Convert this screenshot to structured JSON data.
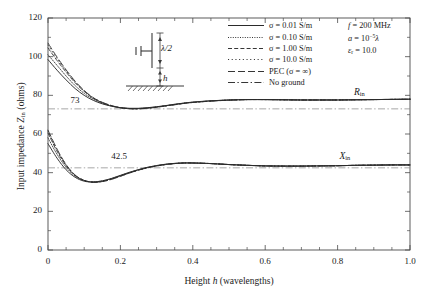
{
  "chart_data": {
    "type": "line",
    "title": "",
    "xlabel": "Height h (wavelengths)",
    "ylabel": "Input impedance Zin (ohms)",
    "xlim": [
      0,
      1.0
    ],
    "ylim": [
      0,
      120
    ],
    "xticks": [
      "0",
      "0.2",
      "0.4",
      "0.6",
      "0.8",
      "1.0"
    ],
    "xtick_values": [
      0,
      0.2,
      0.4,
      0.6,
      0.8,
      1.0
    ],
    "yticks": [
      "0",
      "20",
      "40",
      "60",
      "80",
      "100",
      "120"
    ],
    "ytick_values": [
      0,
      20,
      40,
      60,
      80,
      100,
      120
    ],
    "xminor_step": 0.05,
    "yminor_step": 10,
    "grid": false,
    "legend_position": "top-center",
    "annotations": [
      {
        "name": "Rin",
        "text": "Rin",
        "x": 0.845,
        "y": 80.5
      },
      {
        "name": "Xin",
        "text": "Xin",
        "x": 0.805,
        "y": 47.5
      },
      {
        "name": "asymptote-73",
        "text": "73",
        "x": 0.062,
        "y": 76.5
      },
      {
        "name": "asymptote-42.5",
        "text": "42.5",
        "x": 0.175,
        "y": 47.5
      }
    ],
    "reference_lines": [
      {
        "name": "free-space-resistance",
        "value": 73,
        "style": "dashdot"
      },
      {
        "name": "free-space-reactance",
        "value": 42.5,
        "style": "dashdot"
      }
    ],
    "parameters": [
      "f = 200 MHz",
      "a = 10−5λ",
      "εr = 10.0"
    ],
    "inset": {
      "dipole_length": "λ/2",
      "height_symbol": "h"
    },
    "x": [
      0,
      0.025,
      0.05,
      0.075,
      0.1,
      0.125,
      0.15,
      0.175,
      0.2,
      0.225,
      0.25,
      0.275,
      0.3,
      0.325,
      0.35,
      0.375,
      0.4,
      0.45,
      0.5,
      0.55,
      0.6,
      0.65,
      0.7,
      0.75,
      0.8,
      0.85,
      0.9,
      0.95,
      1.0
    ],
    "series": [
      {
        "name": "σ = 0.01 S/m",
        "style": "solid",
        "Rin": [
          98.5,
          93.0,
          88.0,
          83.5,
          80.0,
          77.4,
          75.6,
          74.4,
          73.6,
          73.3,
          73.3,
          73.6,
          74.1,
          74.7,
          75.4,
          76.0,
          76.5,
          77.2,
          77.6,
          77.8,
          77.8,
          77.7,
          77.6,
          77.6,
          77.6,
          77.7,
          77.8,
          77.9,
          78.0
        ],
        "Xin": [
          55.0,
          47.5,
          41.5,
          37.6,
          35.6,
          35.2,
          35.8,
          37.0,
          38.6,
          40.2,
          41.6,
          42.8,
          43.7,
          44.4,
          44.8,
          45.0,
          45.0,
          44.7,
          44.2,
          43.8,
          43.5,
          43.4,
          43.4,
          43.5,
          43.6,
          43.8,
          43.9,
          44.0,
          44.0
        ]
      },
      {
        "name": "σ = 0.10 S/m",
        "style": "dotted-fine",
        "Rin": [
          101.0,
          95.5,
          90.0,
          85.0,
          81.0,
          78.0,
          75.9,
          74.5,
          73.6,
          73.2,
          73.2,
          73.5,
          74.0,
          74.6,
          75.3,
          75.9,
          76.4,
          77.1,
          77.6,
          77.8,
          77.8,
          77.7,
          77.6,
          77.6,
          77.6,
          77.7,
          77.8,
          77.9,
          78.0
        ],
        "Xin": [
          58.0,
          49.5,
          42.8,
          38.2,
          35.9,
          35.2,
          35.7,
          36.9,
          38.5,
          40.1,
          41.5,
          42.7,
          43.6,
          44.3,
          44.8,
          45.0,
          45.0,
          44.7,
          44.2,
          43.8,
          43.5,
          43.4,
          43.4,
          43.5,
          43.6,
          43.8,
          43.9,
          44.0,
          44.0
        ]
      },
      {
        "name": "σ = 1.00 S/m",
        "style": "dashed",
        "Rin": [
          104.5,
          98.0,
          92.0,
          86.5,
          82.0,
          78.5,
          76.2,
          74.6,
          73.6,
          73.1,
          73.1,
          73.4,
          73.9,
          74.6,
          75.2,
          75.9,
          76.4,
          77.1,
          77.5,
          77.8,
          77.8,
          77.7,
          77.6,
          77.6,
          77.6,
          77.7,
          77.8,
          77.9,
          78.0
        ],
        "Xin": [
          60.5,
          51.0,
          43.6,
          38.5,
          36.0,
          35.1,
          35.5,
          36.7,
          38.3,
          39.9,
          41.4,
          42.6,
          43.5,
          44.2,
          44.7,
          45.0,
          45.0,
          44.7,
          44.2,
          43.8,
          43.5,
          43.4,
          43.4,
          43.5,
          43.6,
          43.8,
          43.9,
          44.0,
          44.0
        ]
      },
      {
        "name": "σ = 10.0 S/m",
        "style": "dotted-spaced",
        "Rin": [
          106.0,
          99.0,
          92.8,
          87.0,
          82.3,
          78.7,
          76.3,
          74.7,
          73.6,
          73.1,
          73.0,
          73.4,
          73.9,
          74.5,
          75.2,
          75.8,
          76.3,
          77.0,
          77.5,
          77.8,
          77.8,
          77.7,
          77.6,
          77.6,
          77.6,
          77.7,
          77.8,
          77.9,
          78.0
        ],
        "Xin": [
          61.5,
          51.8,
          44.0,
          38.7,
          36.0,
          35.0,
          35.4,
          36.6,
          38.2,
          39.8,
          41.3,
          42.5,
          43.5,
          44.2,
          44.7,
          45.0,
          45.0,
          44.7,
          44.2,
          43.8,
          43.5,
          43.4,
          43.4,
          43.5,
          43.6,
          43.8,
          43.9,
          44.0,
          44.0
        ]
      },
      {
        "name": "PEC (σ = ∞)",
        "style": "longdash",
        "Rin": [
          107.0,
          99.8,
          93.2,
          87.3,
          82.5,
          78.8,
          76.4,
          74.7,
          73.6,
          73.1,
          73.0,
          73.3,
          73.8,
          74.5,
          75.1,
          75.8,
          76.3,
          77.0,
          77.5,
          77.8,
          77.8,
          77.7,
          77.6,
          77.6,
          77.6,
          77.7,
          77.8,
          77.9,
          78.0
        ],
        "Xin": [
          62.0,
          52.2,
          44.2,
          38.8,
          36.0,
          35.0,
          35.4,
          36.5,
          38.1,
          39.8,
          41.3,
          42.5,
          43.4,
          44.2,
          44.7,
          45.0,
          45.0,
          44.7,
          44.2,
          43.8,
          43.5,
          43.4,
          43.4,
          43.5,
          43.6,
          43.8,
          43.9,
          44.0,
          44.0
        ]
      },
      {
        "name": "No ground",
        "style": "dashdot",
        "Rin": [
          73,
          73,
          73,
          73,
          73,
          73,
          73,
          73,
          73,
          73,
          73,
          73,
          73,
          73,
          73,
          73,
          73,
          73,
          73,
          73,
          73,
          73,
          73,
          73,
          73,
          73,
          73,
          73,
          73
        ],
        "Xin": [
          42.5,
          42.5,
          42.5,
          42.5,
          42.5,
          42.5,
          42.5,
          42.5,
          42.5,
          42.5,
          42.5,
          42.5,
          42.5,
          42.5,
          42.5,
          42.5,
          42.5,
          42.5,
          42.5,
          42.5,
          42.5,
          42.5,
          42.5,
          42.5,
          42.5,
          42.5,
          42.5,
          42.5,
          42.5
        ]
      }
    ]
  },
  "axes": {
    "ylabel_prefix": "Input impedance ",
    "ylabel_symbol": "Z",
    "ylabel_sub": "in",
    "ylabel_suffix": " (ohms)",
    "xlabel_prefix": "Height ",
    "xlabel_symbol": "h",
    "xlabel_suffix": " (wavelengths)"
  },
  "legend": {
    "entries": [
      {
        "label": "σ = 0.01 S/m",
        "style": "solid"
      },
      {
        "label": "σ = 0.10 S/m",
        "style": "dotted-fine"
      },
      {
        "label": "σ = 1.00 S/m",
        "style": "dashed"
      },
      {
        "label": "σ = 10.0 S/m",
        "style": "dotted-spaced"
      },
      {
        "label": "PEC (σ = ∞)",
        "style": "longdash"
      },
      {
        "label": "No ground",
        "style": "dashdot"
      }
    ]
  },
  "params": {
    "freq_symbol": "f",
    "freq_value": " = 200 MHz",
    "radius_symbol": "a",
    "radius_value_pre": " = 10",
    "radius_exp": "−5",
    "radius_value_post": "λ",
    "eps_symbol": "ε",
    "eps_sub": "r",
    "eps_value": " = 10.0"
  },
  "labels": {
    "rin": "R",
    "rin_sub": "in",
    "xin": "X",
    "xin_sub": "in",
    "ref73": "73",
    "ref425": "42.5",
    "inset_length": "λ/2",
    "inset_height": "h"
  },
  "colors": {
    "axis": "#4a4a4a",
    "curve": "#2b2b2b",
    "reference": "#8a8a8a",
    "text": "#1a1a1a",
    "background": "#ffffff"
  }
}
